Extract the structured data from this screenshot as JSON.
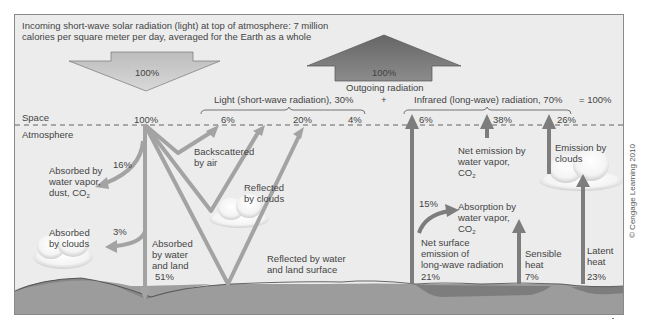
{
  "header": {
    "incoming_line1": "Incoming short-wave solar radiation (light) at top of atmosphere: 7 million",
    "incoming_line2": "calories per square meter per day, averaged for the Earth as a whole",
    "incoming_arrow_pct": "100%",
    "outgoing_arrow_pct": "100%",
    "outgoing_label": "Outgoing radiation"
  },
  "totals": {
    "light_label": "Light (short-wave radiation), 30%",
    "plus": "+",
    "infrared_label": "Infrared (long-wave) radiation, 70%",
    "equals": "= 100%"
  },
  "layers": {
    "space": "Space",
    "atmosphere": "Atmosphere"
  },
  "shortwave": {
    "top_pct": "100%",
    "backscatter_pct": "6%",
    "cloud_reflect_pct": "20%",
    "surface_reflect_pct": "4%",
    "backscatter_label_1": "Backscattered",
    "backscatter_label_2": "by air",
    "reflected_clouds_1": "Reflected",
    "reflected_clouds_2": "by clouds",
    "reflected_surface_1": "Reflected by water",
    "reflected_surface_2": "and land surface",
    "absorbed_vapor_pct": "16%",
    "absorbed_vapor_1": "Absorbed by",
    "absorbed_vapor_2": "water vapor,",
    "absorbed_vapor_3": "dust, CO",
    "absorbed_vapor_sub": "2",
    "absorbed_clouds_pct": "3%",
    "absorbed_clouds_1": "Absorbed",
    "absorbed_clouds_2": "by clouds",
    "absorbed_land_1": "Absorbed",
    "absorbed_land_2": "by water",
    "absorbed_land_3": "and land",
    "absorbed_land_pct": "51%"
  },
  "longwave": {
    "surface_direct_pct": "6%",
    "vapor_emission_pct": "38%",
    "cloud_emission_pct": "26%",
    "net_emission_1": "Net emission by",
    "net_emission_2": "water vapor,",
    "net_emission_3": "CO",
    "net_emission_sub": "2",
    "cloud_emission_1": "Emission by",
    "cloud_emission_2": "clouds",
    "absorption_pct": "15%",
    "absorption_1": "Absorption by",
    "absorption_2": "water vapor,",
    "absorption_3": "CO",
    "absorption_sub": "2",
    "net_surface_1": "Net surface",
    "net_surface_2": "emission of",
    "net_surface_3": "long-wave radiation",
    "net_surface_pct": "21%",
    "sensible_1": "Sensible",
    "sensible_2": "heat",
    "sensible_pct": "7%",
    "latent_1": "Latent",
    "latent_2": "heat",
    "latent_pct": "23%"
  },
  "colors": {
    "background": "#ececec",
    "shortwave_arrow": "#a3a3a3",
    "longwave_arrow": "#7a7a7a",
    "incoming_arrow": "#c9c9c9",
    "outgoing_arrow": "#6e6e6e",
    "ground": "#9c9c9c",
    "water": "#7d7d7d"
  },
  "credit": "© Cengage Learning 2010"
}
